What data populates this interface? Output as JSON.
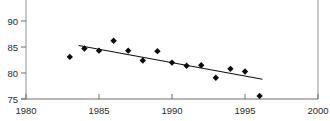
{
  "chart_data": {
    "type": "scatter",
    "title": "",
    "subtitle": "",
    "xlabel": "",
    "ylabel": "",
    "xlim": [
      1980,
      2000
    ],
    "ylim": [
      75,
      92
    ],
    "xticks": [
      1980,
      1985,
      1990,
      1995,
      2000
    ],
    "xtick_labels": [
      "1980",
      "1985",
      "1990",
      "1995",
      "2000"
    ],
    "yticks": [
      75,
      80,
      85,
      90
    ],
    "ytick_labels": [
      "75",
      "80",
      "85",
      "90"
    ],
    "grid": false,
    "legend": null,
    "marker_style": "filled-diamond",
    "marker_color": "#0c0c0c",
    "trendline_color": "#111111",
    "axis_color": "#6e6e6e",
    "x": [
      1983,
      1984,
      1985,
      1986,
      1987,
      1988,
      1989,
      1990,
      1991,
      1992,
      1993,
      1994,
      1995,
      1996
    ],
    "y": [
      83.1,
      84.7,
      84.3,
      86.2,
      84.3,
      82.4,
      84.2,
      82.0,
      81.4,
      81.5,
      79.1,
      80.8,
      80.3,
      75.6
    ],
    "series": [
      {
        "name": "observations",
        "type": "scatter",
        "x": [
          1983,
          1984,
          1985,
          1986,
          1987,
          1988,
          1989,
          1990,
          1991,
          1992,
          1993,
          1994,
          1995,
          1996
        ],
        "values": [
          83.1,
          84.7,
          84.3,
          86.2,
          84.3,
          82.4,
          84.2,
          82.0,
          81.4,
          81.5,
          79.1,
          80.8,
          80.3,
          75.6
        ]
      },
      {
        "name": "trend-line",
        "type": "line",
        "x": [
          1983.6,
          1996.2
        ],
        "values": [
          85.3,
          78.8
        ]
      }
    ],
    "annotations": []
  }
}
